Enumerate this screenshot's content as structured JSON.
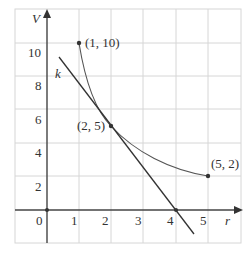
{
  "axes": {
    "x_label": "r",
    "y_label": "V",
    "x_ticks": [
      "0",
      "1",
      "2",
      "3",
      "4",
      "5"
    ],
    "y_ticks": [
      "2",
      "4",
      "6",
      "8",
      "10"
    ]
  },
  "line_label": "k",
  "points": [
    {
      "label": "(1, 10)",
      "r": 1,
      "V": 10
    },
    {
      "label": "(2, 5)",
      "r": 2,
      "V": 5
    },
    {
      "label": "(5, 2)",
      "r": 5,
      "V": 2
    }
  ],
  "colors": {
    "grid": "#d6d6d6",
    "axis": "#444444",
    "curve": "#555555",
    "tangent": "#333333"
  }
}
